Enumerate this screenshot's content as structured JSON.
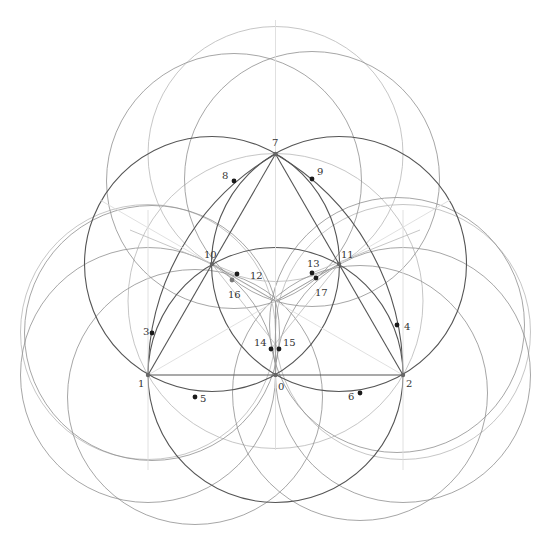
{
  "diagram": {
    "type": "geometric-construction",
    "colors": {
      "background": "#ffffff",
      "dark_stroke": "#555555",
      "mid_stroke": "#8f8f8f",
      "light_stroke": "#b8b8b8",
      "faint_stroke": "#dcdcdc",
      "point_fill": "#1a1a1a",
      "vertex_fill": "#666666",
      "label_color": "#333333"
    },
    "points": [
      {
        "id": "0",
        "label": "0",
        "x": 275.5,
        "y": 375,
        "lx": 278,
        "ly": 390,
        "kind": "vertex"
      },
      {
        "id": "1",
        "label": "1",
        "x": 148,
        "y": 375,
        "lx": 138,
        "ly": 387,
        "kind": "vertex"
      },
      {
        "id": "2",
        "label": "2",
        "x": 403,
        "y": 375,
        "lx": 406,
        "ly": 387,
        "kind": "vertex"
      },
      {
        "id": "3",
        "label": "3",
        "x": 152,
        "y": 333,
        "lx": 143,
        "ly": 335,
        "kind": "dot"
      },
      {
        "id": "4",
        "label": "4",
        "x": 397,
        "y": 325,
        "lx": 404,
        "ly": 330,
        "kind": "dot"
      },
      {
        "id": "5",
        "label": "5",
        "x": 195,
        "y": 397,
        "lx": 200,
        "ly": 402,
        "kind": "dot"
      },
      {
        "id": "6",
        "label": "6",
        "x": 360,
        "y": 393,
        "lx": 348,
        "ly": 400,
        "kind": "dot"
      },
      {
        "id": "7",
        "label": "7",
        "x": 275.5,
        "y": 154,
        "lx": 272,
        "ly": 146,
        "kind": "vertex"
      },
      {
        "id": "8",
        "label": "8",
        "x": 234,
        "y": 181,
        "lx": 222,
        "ly": 179,
        "kind": "dot"
      },
      {
        "id": "9",
        "label": "9",
        "x": 312,
        "y": 179,
        "lx": 317,
        "ly": 175,
        "kind": "dot"
      },
      {
        "id": "10",
        "label": "10",
        "x": 212,
        "y": 264,
        "lx": 204,
        "ly": 258,
        "kind": "vertex"
      },
      {
        "id": "11",
        "label": "11",
        "x": 339,
        "y": 264,
        "lx": 341,
        "ly": 258,
        "kind": "vertex"
      },
      {
        "id": "12",
        "label": "12",
        "x": 237,
        "y": 274,
        "lx": 250,
        "ly": 279,
        "kind": "dot"
      },
      {
        "id": "13",
        "label": "13",
        "x": 312,
        "y": 273,
        "lx": 307,
        "ly": 267,
        "kind": "dot"
      },
      {
        "id": "14",
        "label": "14",
        "x": 271,
        "y": 349,
        "lx": 254,
        "ly": 346,
        "kind": "dot"
      },
      {
        "id": "15",
        "label": "15",
        "x": 279,
        "y": 349,
        "lx": 283,
        "ly": 346,
        "kind": "dot"
      },
      {
        "id": "16",
        "label": "16",
        "x": 232,
        "y": 280,
        "lx": 228,
        "ly": 298,
        "kind": "dot-grey"
      },
      {
        "id": "17",
        "label": "17",
        "x": 316,
        "y": 278,
        "lx": 315,
        "ly": 296,
        "kind": "dot"
      }
    ],
    "centroid": {
      "x": 275.5,
      "y": 301
    },
    "circles": [
      {
        "name": "circle-center-0",
        "cx": 275.5,
        "cy": 375,
        "r": 127.5,
        "tone": "dark"
      },
      {
        "name": "circle-center-10",
        "cx": 212,
        "cy": 264,
        "r": 127.5,
        "tone": "dark"
      },
      {
        "name": "circle-center-11",
        "cx": 339,
        "cy": 264,
        "r": 127.5,
        "tone": "dark"
      },
      {
        "name": "circle-center-7",
        "cx": 275.5,
        "cy": 154,
        "r": 127.5,
        "tone": "light"
      },
      {
        "name": "circle-center-1",
        "cx": 148,
        "cy": 375,
        "r": 127.5,
        "tone": "mid"
      },
      {
        "name": "circle-center-2",
        "cx": 403,
        "cy": 375,
        "r": 127.5,
        "tone": "mid"
      },
      {
        "name": "circle-center-3",
        "cx": 152,
        "cy": 333,
        "r": 127.5,
        "tone": "mid"
      },
      {
        "name": "circle-center-4",
        "cx": 397,
        "cy": 325,
        "r": 127.5,
        "tone": "mid"
      },
      {
        "name": "circle-center-5",
        "cx": 195,
        "cy": 397,
        "r": 127.5,
        "tone": "mid"
      },
      {
        "name": "circle-center-6",
        "cx": 360,
        "cy": 393,
        "r": 127.5,
        "tone": "mid"
      },
      {
        "name": "circle-center-8",
        "cx": 234,
        "cy": 181,
        "r": 127.5,
        "tone": "mid"
      },
      {
        "name": "circle-center-9",
        "cx": 312,
        "cy": 179,
        "r": 127.5,
        "tone": "mid"
      },
      {
        "name": "circumcircle",
        "cx": 275.5,
        "cy": 301,
        "r": 147.5,
        "tone": "light"
      },
      {
        "name": "circle-left-lower",
        "cx": 148,
        "cy": 332,
        "r": 127.5,
        "tone": "light"
      },
      {
        "name": "circle-right-lower",
        "cx": 403,
        "cy": 332,
        "r": 127.5,
        "tone": "light"
      }
    ],
    "arcs": [
      {
        "name": "arc-1-7-center-2",
        "d": "M148,375 A255,255 0 0 1 275.5,154",
        "tone": "dark"
      },
      {
        "name": "arc-7-2-center-1",
        "d": "M275.5,154 A255,255 0 0 1 403,375",
        "tone": "dark"
      }
    ],
    "lines": [
      {
        "name": "triangle-side-1-2",
        "x1": 148,
        "y1": 375,
        "x2": 403,
        "y2": 375,
        "tone": "dark"
      },
      {
        "name": "triangle-side-1-7",
        "x1": 148,
        "y1": 375,
        "x2": 275.5,
        "y2": 154,
        "tone": "dark"
      },
      {
        "name": "triangle-side-2-7",
        "x1": 403,
        "y1": 375,
        "x2": 275.5,
        "y2": 154,
        "tone": "dark"
      },
      {
        "name": "median-7-0",
        "x1": 275.5,
        "y1": 20,
        "x2": 275.5,
        "y2": 450,
        "tone": "faint"
      },
      {
        "name": "median-1-11",
        "x1": 148,
        "y1": 375,
        "x2": 450,
        "y2": 200,
        "tone": "faint"
      },
      {
        "name": "median-2-10",
        "x1": 403,
        "y1": 375,
        "x2": 100,
        "y2": 200,
        "tone": "faint"
      },
      {
        "name": "vertical-at-1",
        "x1": 148,
        "y1": 210,
        "x2": 148,
        "y2": 470,
        "tone": "faint"
      },
      {
        "name": "vertical-at-2",
        "x1": 403,
        "y1": 210,
        "x2": 403,
        "y2": 470,
        "tone": "faint"
      },
      {
        "name": "line-10-centroid",
        "x1": 212,
        "y1": 264,
        "x2": 275.5,
        "y2": 301,
        "tone": "mid"
      },
      {
        "name": "line-11-centroid",
        "x1": 339,
        "y1": 264,
        "x2": 275.5,
        "y2": 301,
        "tone": "mid"
      },
      {
        "name": "line-10-16",
        "x1": 212,
        "y1": 264,
        "x2": 279,
        "y2": 349,
        "tone": "light"
      },
      {
        "name": "line-11-17",
        "x1": 339,
        "y1": 264,
        "x2": 271,
        "y2": 349,
        "tone": "light"
      },
      {
        "name": "line-centroid-0",
        "x1": 275.5,
        "y1": 301,
        "x2": 275.5,
        "y2": 375,
        "tone": "mid"
      },
      {
        "name": "line-10-12-ext",
        "x1": 130,
        "y1": 230,
        "x2": 237,
        "y2": 274,
        "tone": "light"
      },
      {
        "name": "line-11-13-ext",
        "x1": 420,
        "y1": 230,
        "x2": 312,
        "y2": 273,
        "tone": "light"
      }
    ]
  }
}
